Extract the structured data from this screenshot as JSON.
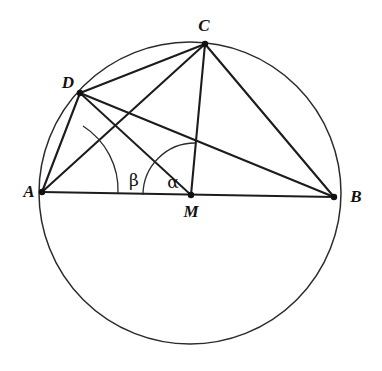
{
  "figure": {
    "background_color": "#ffffff",
    "stroke_color": "#1c1c1c",
    "circle": {
      "label": "circumscribed-circle",
      "center_x": 190,
      "center_y": 193,
      "radius": 151
    },
    "points": [
      {
        "id": "A",
        "label": "A",
        "x": 42,
        "y": 192,
        "label_x": 29,
        "label_y": 192
      },
      {
        "id": "B",
        "label": "B",
        "x": 334,
        "y": 197,
        "label_x": 356,
        "label_y": 197
      },
      {
        "id": "C",
        "label": "C",
        "x": 205,
        "y": 44,
        "label_x": 204,
        "label_y": 26
      },
      {
        "id": "D",
        "label": "D",
        "x": 80,
        "y": 93,
        "label_x": 68,
        "label_y": 83
      },
      {
        "id": "M",
        "label": "M",
        "x": 191,
        "y": 195,
        "label_x": 191,
        "label_y": 212
      }
    ],
    "segments": [
      {
        "id": "AB",
        "from": "A",
        "to": "B"
      },
      {
        "id": "AC",
        "from": "A",
        "to": "C"
      },
      {
        "id": "AD",
        "from": "A",
        "to": "D"
      },
      {
        "id": "DC",
        "from": "D",
        "to": "C"
      },
      {
        "id": "DB",
        "from": "D",
        "to": "B"
      },
      {
        "id": "DM",
        "from": "D",
        "to": "M"
      },
      {
        "id": "CM",
        "from": "C",
        "to": "M"
      },
      {
        "id": "CB",
        "from": "C",
        "to": "B"
      }
    ],
    "angles": [
      {
        "id": "beta",
        "label": "β",
        "vertex": "A",
        "description": "inscribed angle at A between AB and AC",
        "arc_radius": 76,
        "label_x": 134,
        "label_y": 180
      },
      {
        "id": "alpha",
        "label": "α",
        "vertex": "M",
        "description": "central angle at M between MB and MC",
        "arc_radius": 52,
        "label_x": 173,
        "label_y": 182
      }
    ]
  }
}
